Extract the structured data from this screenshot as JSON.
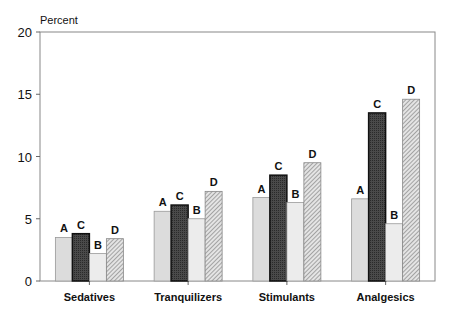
{
  "chart_data": {
    "type": "bar",
    "title": "",
    "ylabel": "Percent",
    "xlabel": "",
    "ylim": [
      0,
      20
    ],
    "yticks": [
      0,
      5,
      10,
      15,
      20
    ],
    "categories": [
      "Sedatives",
      "Tranquilizers",
      "Stimulants",
      "Analgesics"
    ],
    "series": [
      {
        "name": "A",
        "values": [
          3.5,
          5.6,
          6.7,
          6.6
        ]
      },
      {
        "name": "C",
        "values": [
          3.8,
          6.1,
          8.5,
          13.5
        ]
      },
      {
        "name": "B",
        "values": [
          2.2,
          5.0,
          6.3,
          4.6
        ]
      },
      {
        "name": "D",
        "values": [
          3.4,
          7.2,
          9.5,
          14.6
        ]
      }
    ],
    "grid": false,
    "legend": "none; series letters labeled above bars"
  }
}
